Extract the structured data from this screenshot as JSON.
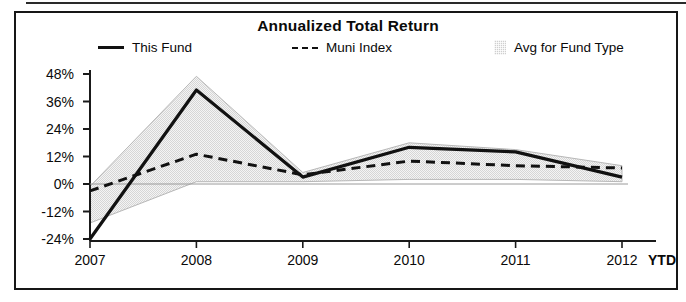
{
  "chart_data": {
    "type": "line",
    "title": "Annualized Total Return",
    "xlabel": "",
    "ylabel": "",
    "grid": false,
    "legend_position": "top",
    "categories": [
      "2007",
      "2008",
      "2009",
      "2010",
      "2011",
      "2012"
    ],
    "last_category_suffix": "YTD",
    "ylim": [
      -24,
      48
    ],
    "yticks": [
      48,
      36,
      24,
      12,
      0,
      -12,
      -24
    ],
    "ytick_labels": [
      "48%",
      "36%",
      "24%",
      "12%",
      "0%",
      "-12%",
      "-24%"
    ],
    "series": [
      {
        "name": "This Fund",
        "style": "solid",
        "color": "#111111",
        "values": [
          -24,
          41,
          3,
          16,
          14,
          3
        ]
      },
      {
        "name": "Muni Index",
        "style": "dashed",
        "color": "#111111",
        "values": [
          -3,
          13,
          4,
          10,
          8,
          7
        ]
      },
      {
        "name": "Avg for Fund Type",
        "style": "band",
        "color": "#d0d0d0",
        "upper": [
          -1,
          47,
          5,
          18,
          15,
          8
        ],
        "lower": [
          -17,
          1,
          1,
          2,
          2,
          1
        ]
      }
    ]
  },
  "chart": {
    "title": "Annualized Total Return",
    "legend": [
      {
        "label": "This Fund",
        "marker": "solid-line-swatch"
      },
      {
        "label": "Muni Index",
        "marker": "dashed-line-swatch"
      },
      {
        "label": "Avg for Fund Type",
        "marker": "shaded-box-swatch"
      }
    ],
    "y_axis": {
      "labels": [
        "48%",
        "36%",
        "24%",
        "12%",
        "0%",
        "-12%",
        "-24%"
      ]
    },
    "x_axis": {
      "labels": [
        "2007",
        "2008",
        "2009",
        "2010",
        "2011",
        "2012"
      ],
      "ytd_label": "YTD"
    }
  }
}
